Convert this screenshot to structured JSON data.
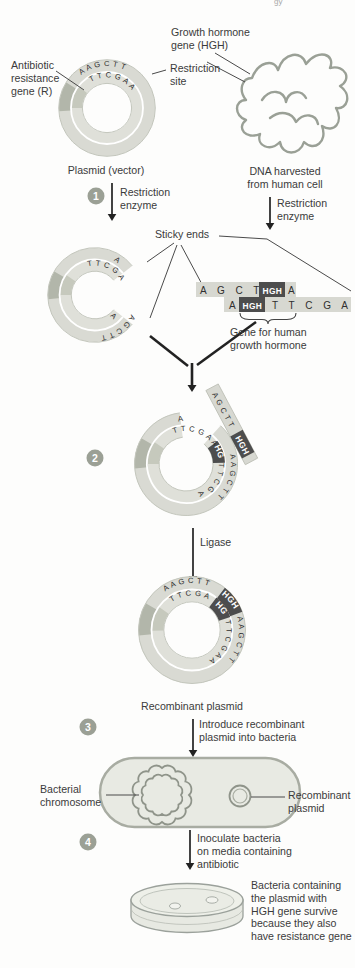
{
  "page": {
    "header_fragment": "gy"
  },
  "colors": {
    "hgh_box": "#4d4d4d",
    "step_badge": "#9ba095",
    "ring": "#d9dad3",
    "ring_segment": "#b2b6aa",
    "organism_outline": "#9aa096",
    "label_text": "#3b3b3b"
  },
  "steps": {
    "s1": "1",
    "s2": "2",
    "s3": "3",
    "s4": "4"
  },
  "labels": {
    "growth_hormone": "Growth hormone\ngene (HGH)",
    "antibiotic": "Antibiotic\nresistance\ngene (R)",
    "restriction_site": "Restriction\nsite",
    "plasmid_vector": "Plasmid (vector)",
    "dna_harvested": "DNA harvested\nfrom human cell",
    "restriction_enzyme": "Restriction\nenzyme",
    "sticky_ends": "Sticky ends",
    "gene_for_hgh": "Gene for human\ngrowth hormone",
    "ligase": "Ligase",
    "recombinant_plasmid": "Recombinant plasmid",
    "introduce": "Introduce recombinant\nplasmid into bacteria",
    "bacterial_chromosome": "Bacterial\nchromosome",
    "recombinant_plasmid_2": "Recombinant\nplasmid",
    "inoculate": "Inoculate bacteria\non media containing\nantibiotic",
    "survive": "Bacteria containing\nthe plasmid with\nHGH gene survive\nbecause they also\nhave resistance gene"
  },
  "sequences": {
    "hgh": "HGH",
    "plasmid_outer": "A A G C T T",
    "plasmid_inner": "T T C G A A",
    "cut_top_outer": "A",
    "cut_top_inner": "T T C G A",
    "cut_bottom_outer": "A G C T T",
    "cut_bottom_inner": "A",
    "frag_top": "A G C T T",
    "frag_top_end": "A",
    "frag_bottom_start": "A",
    "frag_bottom": "T T C G A",
    "s2_top_outer": "A",
    "s2_inner_left": "T T C G A A",
    "s2_inner_right": "T T C G A",
    "s2_inner_end": "A",
    "s2_outer_right": "A A G C T T",
    "s2_flap": "A G C T T",
    "rec_outer_top": "A A G C T T",
    "rec_outer_right": "A A G C T T",
    "rec_inner_top": "T T C G A A",
    "rec_inner_right": "T T C G A A"
  }
}
